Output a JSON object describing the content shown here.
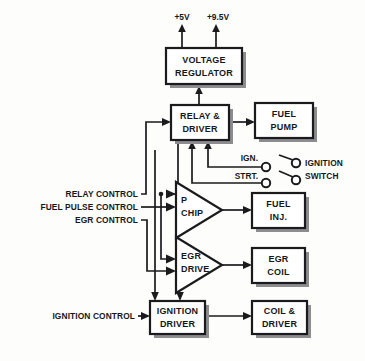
{
  "diagram": {
    "colors": {
      "line": "#1b1b1e",
      "fill": "#ffffff",
      "shadow": "#8d8d90",
      "background": "#fdfdfb"
    },
    "power_rails": [
      {
        "id": "rail-5v",
        "label": "+5V"
      },
      {
        "id": "rail-9v5",
        "label": "+9.5V"
      }
    ],
    "blocks": [
      {
        "id": "voltage-regulator",
        "label_line1": "VOLTAGE",
        "label_line2": "REGULATOR"
      },
      {
        "id": "relay-driver",
        "label_line1": "RELAY &",
        "label_line2": "DRIVER"
      },
      {
        "id": "fuel-pump",
        "label_line1": "FUEL",
        "label_line2": "PUMP"
      },
      {
        "id": "fuel-inj",
        "label_line1": "FUEL",
        "label_line2": "INJ."
      },
      {
        "id": "egr-coil",
        "label_line1": "EGR",
        "label_line2": "COIL"
      },
      {
        "id": "ignition-driver",
        "label_line1": "IGNITION",
        "label_line2": "DRIVER"
      },
      {
        "id": "coil-driver",
        "label_line1": "COIL &",
        "label_line2": "DRIVER"
      }
    ],
    "amplifiers": [
      {
        "id": "p-chip",
        "label_line1": "P",
        "label_line2": "CHIP"
      },
      {
        "id": "egr-drive",
        "label_line1": "EGR",
        "label_line2": "DRIVE"
      }
    ],
    "input_labels": [
      {
        "id": "relay-control",
        "label": "RELAY CONTROL"
      },
      {
        "id": "fuel-pulse-control",
        "label": "FUEL PULSE CONTROL"
      },
      {
        "id": "egr-control",
        "label": "EGR CONTROL"
      },
      {
        "id": "ignition-control",
        "label": "IGNITION CONTROL"
      }
    ],
    "switch": {
      "id": "ignition-switch",
      "label_line1": "IGNITION",
      "label_line2": "SWITCH",
      "terminals": [
        {
          "id": "terminal-ign",
          "label": "IGN."
        },
        {
          "id": "terminal-strt",
          "label": "STRT."
        }
      ]
    }
  }
}
